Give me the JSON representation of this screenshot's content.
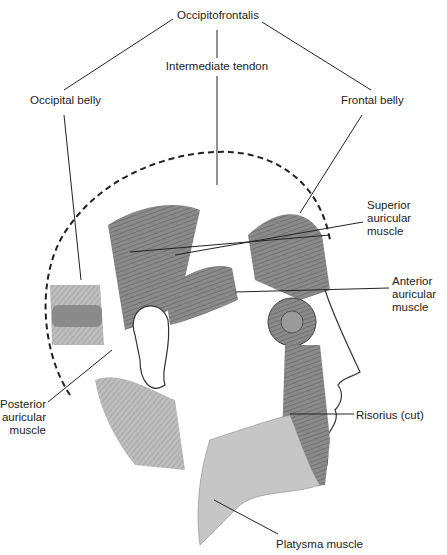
{
  "diagram": {
    "colors": {
      "muscle_dark": "#7d7d7d",
      "muscle_mid": "#9a9a9a",
      "muscle_light": "#c4c4c4",
      "line": "#222222",
      "skin": "#ffffff"
    },
    "labels": [
      {
        "id": "occipitofrontalis",
        "text": "Occipitofrontalis"
      },
      {
        "id": "intermediate_tendon",
        "text": "Intermediate tendon"
      },
      {
        "id": "occipital_belly",
        "text": "Occipital belly"
      },
      {
        "id": "frontal_belly",
        "text": "Frontal belly"
      },
      {
        "id": "superior_auricular",
        "text": "Superior\nauricular\nmuscle"
      },
      {
        "id": "anterior_auricular",
        "text": "Anterior\nauricular\nmuscle"
      },
      {
        "id": "posterior_auricular",
        "text": "Posterior\nauricular\nmuscle"
      },
      {
        "id": "risorius",
        "text": "Risorius (cut)"
      },
      {
        "id": "platysma",
        "text": "Platysma muscle"
      }
    ]
  }
}
